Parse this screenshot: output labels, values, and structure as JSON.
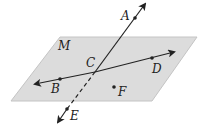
{
  "diagram": {
    "plane": {
      "label": "M",
      "fill": "#dcdcdc",
      "stroke": "#bdbdbd"
    },
    "points": {
      "A": "A",
      "B": "B",
      "C": "C",
      "D": "D",
      "E": "E",
      "F": "F"
    },
    "lines": [
      {
        "name": "line-AE",
        "through": [
          "A",
          "C",
          "E"
        ],
        "dashed_below_plane": true
      },
      {
        "name": "line-BD",
        "through": [
          "B",
          "C",
          "D"
        ]
      }
    ]
  }
}
